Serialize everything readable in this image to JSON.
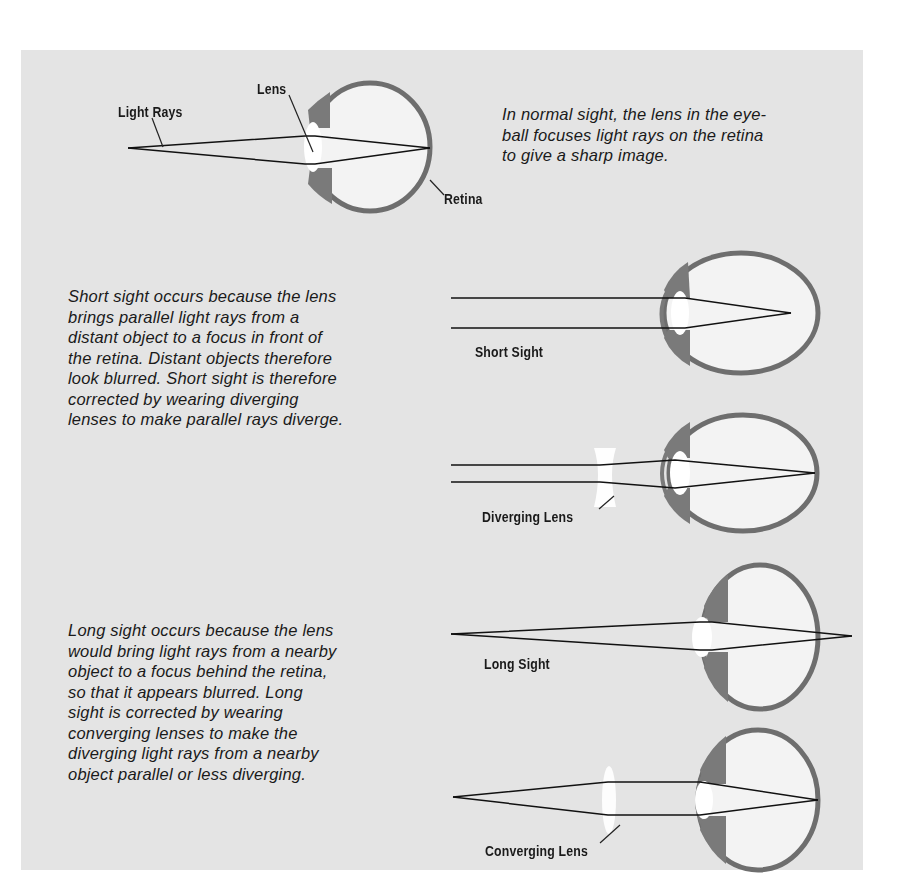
{
  "colors": {
    "page_background": "#ffffff",
    "panel_background": "#e4e4e4",
    "eye_wall": "#6e6e6e",
    "eye_interior": "#f3f3f3",
    "lens_fill": "#ffffff",
    "ray_color": "#111111",
    "text_color": "#1a1a1a"
  },
  "normal_sight": {
    "labels": {
      "light_rays": "Light Rays",
      "lens": "Lens",
      "retina": "Retina"
    },
    "caption_lines": [
      "In normal sight, the lens in the eye-",
      "ball focuses light rays on the retina",
      "to give a sharp image."
    ]
  },
  "short_sight": {
    "caption_lines": [
      "Short sight occurs because the lens",
      "brings parallel light rays from a",
      "distant object to a focus in front of",
      "the retina. Distant objects therefore",
      "look blurred. Short sight is therefore",
      "corrected by wearing diverging",
      "lenses to make parallel rays diverge."
    ],
    "labels": {
      "short_sight": "Short Sight",
      "diverging_lens": "Diverging Lens"
    }
  },
  "long_sight": {
    "caption_lines": [
      "Long sight occurs because the lens",
      "would bring light rays from a nearby",
      "object to a focus behind the retina,",
      "so that it appears blurred. Long",
      "sight is corrected by wearing",
      "converging lenses to make the",
      "diverging light rays from a nearby",
      "object parallel or less diverging."
    ],
    "labels": {
      "long_sight": "Long Sight",
      "converging_lens": "Converging Lens"
    }
  }
}
